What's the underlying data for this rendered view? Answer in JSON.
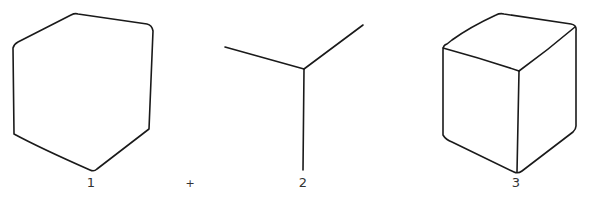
{
  "figure": {
    "panels": [
      {
        "id": 1,
        "label": "1",
        "content": "Hexagonal cube silhouette outline"
      },
      {
        "id": 2,
        "label": "2",
        "content": "Y-shaped set of three inner edges meeting at the near corner"
      },
      {
        "id": 3,
        "label": "3",
        "content": "Completed cube (outline plus inner edges)"
      }
    ],
    "operator": "+",
    "stroke_color": "#1a1a1a",
    "background_color": "#ffffff"
  }
}
